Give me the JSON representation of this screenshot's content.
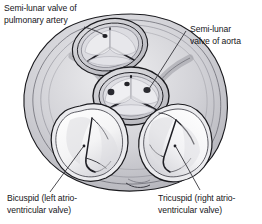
{
  "figure": {
    "kind": "anatomical-illustration",
    "background_color": "#ffffff",
    "ink_color": "#16161a"
  },
  "labels": {
    "pulmonary": {
      "text": "Semi-lunar valve of\npulmonary artery",
      "name": "semi-lunar-valve-of-pulmonary-artery"
    },
    "aorta": {
      "text": "Semi-lunar\nvalve of aorta",
      "name": "semi-lunar-valve-of-aorta"
    },
    "bicuspid": {
      "text": "Bicuspid (left atrio-\nventricular valve)",
      "name": "bicuspid-left-atrioventricular-valve"
    },
    "tricuspid": {
      "text": "Tricuspid (right atrio-\nventricular valve)",
      "name": "tricuspid-right-atrioventricular-valve"
    }
  },
  "structures": {
    "pulmonary_valve": {
      "label": "Semi-lunar valve of pulmonary artery",
      "leaflets": 3
    },
    "aortic_valve": {
      "label": "Semi-lunar valve of aorta",
      "leaflets": 3
    },
    "mitral_valve": {
      "label": "Bicuspid (left atrio-ventricular valve)",
      "leaflets": 2
    },
    "tricuspid_valve": {
      "label": "Tricuspid (right atrio-ventricular valve)",
      "leaflets": 3
    },
    "myocardium": {
      "label": "Cardiac muscle wall"
    }
  },
  "colors": {
    "outline": "#1a1a1e",
    "muscle_light": "#e3e3e5",
    "muscle_mid": "#c9c9cd",
    "muscle_dark": "#aeaeb4",
    "valve_fill": "#f7f7f8",
    "lumen_shadow": "#b9b9c0",
    "leader_line": "#2b2b30"
  }
}
